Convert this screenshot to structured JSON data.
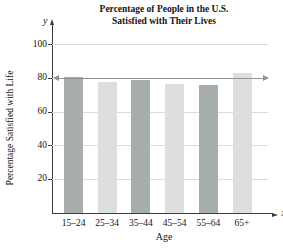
{
  "chart_data": {
    "type": "bar",
    "title_line1": "Percentage of People in the U.S.",
    "title_line2": "Satisfied with Their Lives",
    "categories": [
      "15–24",
      "25–34",
      "35–44",
      "45–54",
      "55–64",
      "65+"
    ],
    "values": [
      81,
      78,
      79,
      77,
      76,
      83
    ],
    "bar_shades": [
      "dark",
      "light",
      "dark",
      "light",
      "dark",
      "light"
    ],
    "xlabel": "Age",
    "ylabel": "Percentage Satisfied with Life",
    "x_axis_symbol": "x",
    "y_axis_symbol": "y",
    "y_ticks": [
      20,
      40,
      60,
      80,
      100
    ],
    "ylim": [
      0,
      110
    ],
    "reference_line_value": 80,
    "grid": true,
    "legend": "none",
    "colors": {
      "bar_dark": "#a7adab",
      "bar_light": "#dcdfdd",
      "gridline": "#d9dcda",
      "reference_line": "#8d9594",
      "axis": "#3c3c3c",
      "text": "#141414",
      "background": "#ffffff"
    }
  }
}
